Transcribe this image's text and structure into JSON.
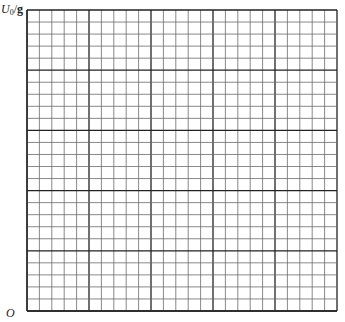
{
  "chart_data": {
    "type": "grid",
    "title": "",
    "xlabel": "",
    "ylabel": "U0/g",
    "ylabel_parts": {
      "symbol": "U",
      "subscript": "0",
      "unit": "g"
    },
    "origin_label": "O",
    "grid": {
      "columns": 25,
      "rows": 25,
      "major_every": 5,
      "x0": 27,
      "y0": 10,
      "x1": 337,
      "y1": 311,
      "minor_color": "#6b6b6b",
      "major_color": "#222222"
    },
    "series": []
  }
}
